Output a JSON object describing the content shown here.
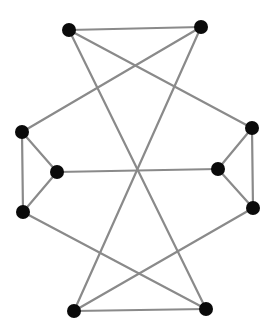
{
  "diagram": {
    "type": "graph",
    "directed": false,
    "colors": {
      "background": "#ffffff",
      "edge": "#8a8a8a",
      "node": "#0a0a0a"
    },
    "node_radius": 7,
    "nodes": [
      {
        "id": "A",
        "x": 69,
        "y": 30
      },
      {
        "id": "B",
        "x": 201,
        "y": 27
      },
      {
        "id": "C",
        "x": 22,
        "y": 132
      },
      {
        "id": "D",
        "x": 252,
        "y": 128
      },
      {
        "id": "E",
        "x": 57,
        "y": 172
      },
      {
        "id": "F",
        "x": 218,
        "y": 169
      },
      {
        "id": "G",
        "x": 23,
        "y": 212
      },
      {
        "id": "H",
        "x": 253,
        "y": 208
      },
      {
        "id": "I",
        "x": 74,
        "y": 311
      },
      {
        "id": "J",
        "x": 206,
        "y": 309
      }
    ],
    "edges": [
      [
        "A",
        "B"
      ],
      [
        "A",
        "J"
      ],
      [
        "A",
        "D"
      ],
      [
        "B",
        "C"
      ],
      [
        "B",
        "I"
      ],
      [
        "C",
        "E"
      ],
      [
        "C",
        "G"
      ],
      [
        "E",
        "G"
      ],
      [
        "E",
        "F"
      ],
      [
        "D",
        "F"
      ],
      [
        "D",
        "H"
      ],
      [
        "F",
        "H"
      ],
      [
        "G",
        "J"
      ],
      [
        "H",
        "I"
      ],
      [
        "I",
        "J"
      ]
    ]
  }
}
